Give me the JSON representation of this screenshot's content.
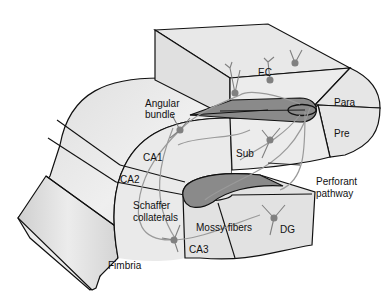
{
  "diagram": {
    "labels": {
      "ec": "EC",
      "para": "Para",
      "pre": "Pre",
      "angular_bundle_line1": "Angular",
      "angular_bundle_line2": "bundle",
      "ca1": "CA1",
      "ca2": "CA2",
      "sub": "Sub",
      "schaffer_line1": "Schaffer",
      "schaffer_line2": "collaterals",
      "mossy_fibers": "Mossy fibers",
      "perforant_line1": "Perforant",
      "perforant_line2": "pathway",
      "dg": "DG",
      "ca3": "CA3",
      "fimbria": "Fimbria"
    },
    "colors": {
      "tissue_fill": "#e4e4e4",
      "tissue_light": "#efefef",
      "outline": "#111111",
      "pathway_fill": "#8a8a8a",
      "neuron": "#808080",
      "axon": "#9a9a9a"
    }
  }
}
